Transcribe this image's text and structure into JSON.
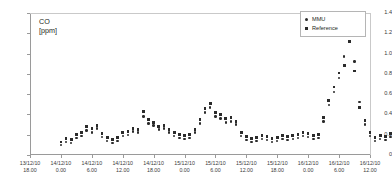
{
  "chart_data": {
    "type": "scatter",
    "title": "",
    "axis_title": [
      "CO",
      "[ppm]"
    ],
    "ylabel": "CO [ppm]",
    "xlabel": "",
    "ylim": [
      0,
      1.4
    ],
    "yticks": [
      "0",
      "0.2",
      "0.4",
      "0.6",
      "0.8",
      "1.0",
      "1.2",
      "1.4"
    ],
    "ytick_values": [
      0,
      0.2,
      0.4,
      0.6,
      0.8,
      1.0,
      1.2,
      1.4
    ],
    "grid": false,
    "legend_position": "top-right",
    "xticks": [
      {
        "date": "13/12/10",
        "time": "18.00"
      },
      {
        "date": "14/12/10",
        "time": "0.00"
      },
      {
        "date": "14/12/10",
        "time": "6.00"
      },
      {
        "date": "14/12/10",
        "time": "12.00"
      },
      {
        "date": "14/12/10",
        "time": "18.00"
      },
      {
        "date": "15/12/10",
        "time": "0.00"
      },
      {
        "date": "15/12/10",
        "time": "6.00"
      },
      {
        "date": "15/12/10",
        "time": "12.00"
      },
      {
        "date": "15/12/10",
        "time": "18.00"
      },
      {
        "date": "16/12/10",
        "time": "0.00"
      },
      {
        "date": "16/12/10",
        "time": "6.00"
      },
      {
        "date": "16/12/10",
        "time": "12.00"
      }
    ],
    "xlim_hours": [
      0,
      66
    ],
    "series": [
      {
        "name": "MMU",
        "marker": "circle",
        "color": "#2b2b2b",
        "points": [
          [
            6.0,
            0.1
          ],
          [
            7.0,
            0.13
          ],
          [
            8.0,
            0.12
          ],
          [
            9.0,
            0.17
          ],
          [
            10.0,
            0.19
          ],
          [
            11.0,
            0.24
          ],
          [
            12.0,
            0.22
          ],
          [
            13.0,
            0.26
          ],
          [
            14.0,
            0.18
          ],
          [
            15.0,
            0.14
          ],
          [
            16.0,
            0.12
          ],
          [
            17.0,
            0.14
          ],
          [
            18.0,
            0.19
          ],
          [
            19.0,
            0.2
          ],
          [
            20.0,
            0.23
          ],
          [
            21.0,
            0.22
          ],
          [
            22.0,
            0.38
          ],
          [
            23.0,
            0.31
          ],
          [
            24.0,
            0.29
          ],
          [
            25.0,
            0.25
          ],
          [
            26.0,
            0.26
          ],
          [
            27.0,
            0.22
          ],
          [
            28.0,
            0.19
          ],
          [
            29.0,
            0.17
          ],
          [
            30.0,
            0.16
          ],
          [
            31.0,
            0.17
          ],
          [
            32.0,
            0.22
          ],
          [
            33.0,
            0.31
          ],
          [
            34.0,
            0.42
          ],
          [
            35.0,
            0.47
          ],
          [
            36.0,
            0.38
          ],
          [
            37.0,
            0.36
          ],
          [
            38.0,
            0.32
          ],
          [
            39.0,
            0.33
          ],
          [
            40.0,
            0.3
          ],
          [
            41.0,
            0.19
          ],
          [
            42.0,
            0.15
          ],
          [
            43.0,
            0.13
          ],
          [
            44.0,
            0.14
          ],
          [
            45.0,
            0.16
          ],
          [
            46.0,
            0.15
          ],
          [
            47.0,
            0.13
          ],
          [
            48.0,
            0.14
          ],
          [
            49.0,
            0.16
          ],
          [
            50.0,
            0.15
          ],
          [
            51.0,
            0.16
          ],
          [
            52.0,
            0.17
          ],
          [
            53.0,
            0.19
          ],
          [
            54.0,
            0.18
          ],
          [
            55.0,
            0.16
          ],
          [
            56.0,
            0.17
          ],
          [
            57.0,
            0.33
          ],
          [
            58.0,
            0.49
          ],
          [
            59.0,
            0.62
          ],
          [
            60.0,
            0.76
          ],
          [
            61.0,
            0.97
          ],
          [
            62.0,
            1.21
          ],
          [
            63.0,
            0.92
          ],
          [
            64.0,
            0.52
          ],
          [
            65.0,
            0.3
          ],
          [
            66.0,
            0.19
          ],
          [
            67.0,
            0.14
          ],
          [
            68.0,
            0.16
          ],
          [
            69.0,
            0.15
          ],
          [
            70.0,
            0.18
          ],
          [
            71.0,
            0.2
          ],
          [
            72.0,
            0.19
          ],
          [
            73.0,
            0.22
          ],
          [
            74.0,
            0.21
          ],
          [
            75.0,
            0.17
          ],
          [
            76.0,
            0.16
          ],
          [
            77.0,
            0.15
          ]
        ]
      },
      {
        "name": "Reference",
        "marker": "square",
        "color": "#2b2b2b",
        "points": [
          [
            6.0,
            0.13
          ],
          [
            7.0,
            0.16
          ],
          [
            8.0,
            0.15
          ],
          [
            9.0,
            0.2
          ],
          [
            10.0,
            0.22
          ],
          [
            11.0,
            0.28
          ],
          [
            12.0,
            0.26
          ],
          [
            13.0,
            0.29
          ],
          [
            14.0,
            0.21
          ],
          [
            15.0,
            0.17
          ],
          [
            16.0,
            0.15
          ],
          [
            17.0,
            0.17
          ],
          [
            18.0,
            0.22
          ],
          [
            19.0,
            0.23
          ],
          [
            20.0,
            0.26
          ],
          [
            21.0,
            0.25
          ],
          [
            22.0,
            0.43
          ],
          [
            23.0,
            0.35
          ],
          [
            24.0,
            0.32
          ],
          [
            25.0,
            0.28
          ],
          [
            26.0,
            0.29
          ],
          [
            27.0,
            0.25
          ],
          [
            28.0,
            0.22
          ],
          [
            29.0,
            0.2
          ],
          [
            30.0,
            0.19
          ],
          [
            31.0,
            0.2
          ],
          [
            32.0,
            0.25
          ],
          [
            33.0,
            0.35
          ],
          [
            34.0,
            0.46
          ],
          [
            35.0,
            0.51
          ],
          [
            36.0,
            0.42
          ],
          [
            37.0,
            0.4
          ],
          [
            38.0,
            0.36
          ],
          [
            39.0,
            0.37
          ],
          [
            40.0,
            0.33
          ],
          [
            41.0,
            0.22
          ],
          [
            42.0,
            0.18
          ],
          [
            43.0,
            0.16
          ],
          [
            44.0,
            0.17
          ],
          [
            45.0,
            0.19
          ],
          [
            46.0,
            0.18
          ],
          [
            47.0,
            0.16
          ],
          [
            48.0,
            0.17
          ],
          [
            49.0,
            0.19
          ],
          [
            50.0,
            0.18
          ],
          [
            51.0,
            0.19
          ],
          [
            52.0,
            0.2
          ],
          [
            53.0,
            0.22
          ],
          [
            54.0,
            0.21
          ],
          [
            55.0,
            0.19
          ],
          [
            56.0,
            0.2
          ],
          [
            57.0,
            0.37
          ],
          [
            58.0,
            0.54
          ],
          [
            59.0,
            0.67
          ],
          [
            60.0,
            0.81
          ],
          [
            61.0,
            0.88
          ],
          [
            62.0,
            1.12
          ],
          [
            63.0,
            0.83
          ],
          [
            64.0,
            0.47
          ],
          [
            65.0,
            0.34
          ],
          [
            66.0,
            0.22
          ],
          [
            67.0,
            0.17
          ],
          [
            68.0,
            0.19
          ],
          [
            69.0,
            0.18
          ],
          [
            70.0,
            0.21
          ],
          [
            71.0,
            0.24
          ],
          [
            72.0,
            0.23
          ],
          [
            73.0,
            0.26
          ],
          [
            74.0,
            0.25
          ],
          [
            75.0,
            0.2
          ],
          [
            76.0,
            0.19
          ],
          [
            77.0,
            0.18
          ]
        ]
      }
    ]
  },
  "legend": {
    "items": [
      {
        "label": "MMU",
        "marker": "circle"
      },
      {
        "label": "Reference",
        "marker": "square"
      }
    ]
  }
}
